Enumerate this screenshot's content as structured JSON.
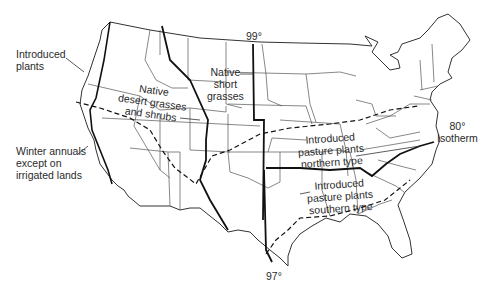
{
  "map": {
    "title": "",
    "labels": {
      "introduced_plants": [
        "Introduced",
        "plants"
      ],
      "winter_annuals": [
        "Winter annuals",
        "except on",
        "irrigated lands"
      ],
      "native_desert": [
        "Native",
        "desert grasses",
        "and shrubs"
      ],
      "native_short": [
        "Native",
        "short",
        "grasses"
      ],
      "pasture_northern": [
        "Introduced",
        "pasture plants",
        "northern type"
      ],
      "pasture_southern": [
        "Introduced",
        "pasture plants",
        "southern type"
      ],
      "isotherm": [
        "80°",
        "Isotherm"
      ],
      "meridian_99": "99°",
      "meridian_97": "97°"
    },
    "colors": {
      "outline": "#2a2a2a",
      "state_lines": "#444444",
      "region_lines": "#111111",
      "background": "#ffffff"
    }
  }
}
